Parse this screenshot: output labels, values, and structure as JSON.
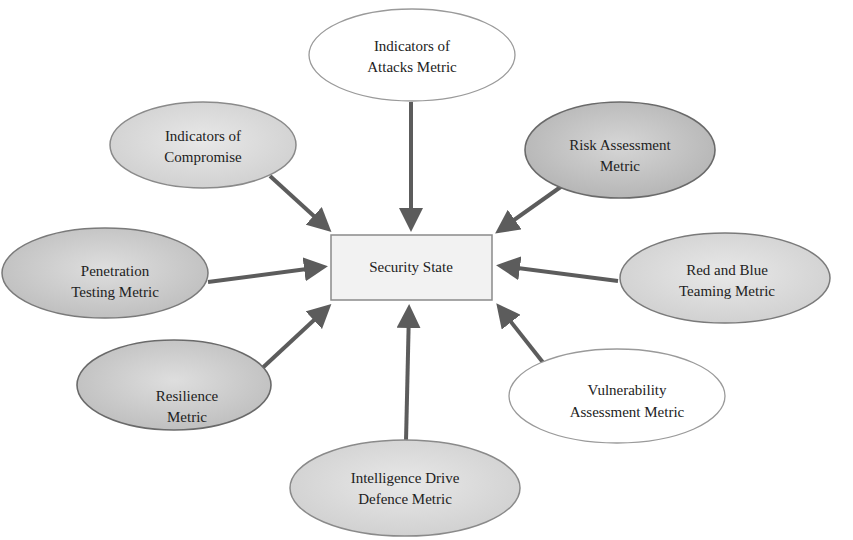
{
  "diagram": {
    "type": "hub-and-spoke",
    "center": {
      "label": "Security State",
      "fill": "#f2f2f2",
      "stroke": "#8a8a8a"
    },
    "nodes": [
      {
        "id": "indicators-of-attacks",
        "line1": "Indicators of",
        "line2": "Attacks Metric",
        "fill": "#ffffff",
        "stroke": "#9a9a9a"
      },
      {
        "id": "indicators-of-compromise",
        "line1": "Indicators of",
        "line2": "Compromise",
        "fill": "#dcdcdc",
        "stroke": "#8a8a8a"
      },
      {
        "id": "risk-assessment",
        "line1": "Risk Assessment",
        "line2": "Metric",
        "fill": "#c8c8c8",
        "stroke": "#6a6a6a"
      },
      {
        "id": "penetration-testing",
        "line1": "Penetration",
        "line2": "Testing Metric",
        "fill": "#d4d4d4",
        "stroke": "#7a7a7a"
      },
      {
        "id": "red-and-blue-teaming",
        "line1": "Red and Blue",
        "line2": "Teaming Metric",
        "fill": "#dadada",
        "stroke": "#7a7a7a"
      },
      {
        "id": "resilience",
        "line1": "Resilience",
        "line2": "Metric",
        "fill": "#cdcdcd",
        "stroke": "#6a6a6a"
      },
      {
        "id": "vulnerability-assessment",
        "line1": "Vulnerability",
        "line2": "Assessment Metric",
        "fill": "#ffffff",
        "stroke": "#9a9a9a"
      },
      {
        "id": "intelligence-drive-defence",
        "line1": "Intelligence Drive",
        "line2": "Defence Metric",
        "fill": "#d8d8d8",
        "stroke": "#8a8a8a"
      }
    ],
    "arrow_color": "#5c5c5c"
  }
}
